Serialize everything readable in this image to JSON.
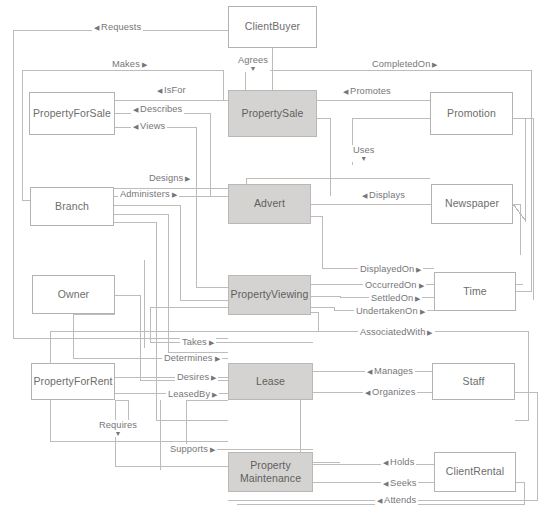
{
  "diagram": {
    "colors": {
      "shaded_fill": "#d4d3d1",
      "box_border": "#b3b3b1",
      "line": "#b8b8b6",
      "text": "#6d6d6b",
      "label_text": "#76767a",
      "background": "#ffffff"
    },
    "entities": [
      {
        "id": "client_buyer",
        "label": "ClientBuyer",
        "shaded": false,
        "x": 228,
        "y": 6,
        "w": 89,
        "h": 42
      },
      {
        "id": "property_for_sale",
        "label": "PropertyForSale",
        "shaded": false,
        "x": 29,
        "y": 92,
        "w": 86,
        "h": 43
      },
      {
        "id": "property_sale",
        "label": "PropertySale",
        "shaded": true,
        "x": 228,
        "y": 90,
        "w": 89,
        "h": 47
      },
      {
        "id": "promotion",
        "label": "Promotion",
        "shaded": false,
        "x": 430,
        "y": 92,
        "w": 83,
        "h": 43
      },
      {
        "id": "branch",
        "label": "Branch",
        "shaded": false,
        "x": 30,
        "y": 187,
        "w": 84,
        "h": 39
      },
      {
        "id": "advert",
        "label": "Advert",
        "shaded": true,
        "x": 228,
        "y": 184,
        "w": 83,
        "h": 40
      },
      {
        "id": "newspaper",
        "label": "Newspaper",
        "shaded": false,
        "x": 431,
        "y": 184,
        "w": 82,
        "h": 40
      },
      {
        "id": "owner",
        "label": "Owner",
        "shaded": false,
        "x": 32,
        "y": 275,
        "w": 83,
        "h": 39
      },
      {
        "id": "property_viewing",
        "label": "PropertyViewing",
        "shaded": true,
        "x": 228,
        "y": 275,
        "w": 83,
        "h": 40
      },
      {
        "id": "time",
        "label": "Time",
        "shaded": false,
        "x": 434,
        "y": 272,
        "w": 82,
        "h": 39
      },
      {
        "id": "property_for_rent",
        "label": "PropertyForRent",
        "shaded": false,
        "x": 31,
        "y": 363,
        "w": 84,
        "h": 37
      },
      {
        "id": "lease",
        "label": "Lease",
        "shaded": true,
        "x": 228,
        "y": 363,
        "w": 85,
        "h": 37
      },
      {
        "id": "staff",
        "label": "Staff",
        "shaded": false,
        "x": 432,
        "y": 363,
        "w": 83,
        "h": 37
      },
      {
        "id": "property_maintenance",
        "label": "Property\nMaintenance",
        "shaded": true,
        "x": 228,
        "y": 452,
        "w": 85,
        "h": 40
      },
      {
        "id": "client_rental",
        "label": "ClientRental",
        "shaded": false,
        "x": 434,
        "y": 452,
        "w": 82,
        "h": 40
      }
    ],
    "relationships": [
      {
        "id": "requests",
        "label": "Requests",
        "arrow": "left",
        "x": 92,
        "y": 22,
        "dir": "l"
      },
      {
        "id": "makes",
        "label": "Makes",
        "arrow": "right",
        "x": 110,
        "y": 59,
        "dir": "r"
      },
      {
        "id": "agrees",
        "label": "Agrees",
        "arrow": "down",
        "x": 236,
        "y": 55,
        "dir": "dn"
      },
      {
        "id": "completed_on",
        "label": "CompletedOn",
        "arrow": "right",
        "x": 370,
        "y": 59,
        "dir": "r"
      },
      {
        "id": "is_for",
        "label": "IsFor",
        "arrow": "left",
        "x": 155,
        "y": 85,
        "dir": "l"
      },
      {
        "id": "promotes",
        "label": "Promotes",
        "arrow": "left",
        "x": 341,
        "y": 86,
        "dir": "l"
      },
      {
        "id": "describes",
        "label": "Describes",
        "arrow": "left",
        "x": 131,
        "y": 104,
        "dir": "l"
      },
      {
        "id": "views",
        "label": "Views",
        "arrow": "left",
        "x": 131,
        "y": 121,
        "dir": "l"
      },
      {
        "id": "uses",
        "label": "Uses",
        "arrow": "down",
        "x": 351,
        "y": 145,
        "dir": "dn"
      },
      {
        "id": "designs",
        "label": "Designs",
        "arrow": "right",
        "x": 147,
        "y": 173,
        "dir": "r"
      },
      {
        "id": "administers",
        "label": "Administers",
        "arrow": "right",
        "x": 118,
        "y": 189,
        "dir": "r"
      },
      {
        "id": "displays",
        "label": "Displays",
        "arrow": "left",
        "x": 360,
        "y": 190,
        "dir": "l"
      },
      {
        "id": "displayed_on",
        "label": "DisplayedOn",
        "arrow": "right",
        "x": 358,
        "y": 264,
        "dir": "r"
      },
      {
        "id": "occurred_on",
        "label": "OccurredOn",
        "arrow": "right",
        "x": 363,
        "y": 280,
        "dir": "r"
      },
      {
        "id": "settled_on",
        "label": "SettledOn",
        "arrow": "right",
        "x": 369,
        "y": 293,
        "dir": "r"
      },
      {
        "id": "undertaken_on",
        "label": "UndertakenOn",
        "arrow": "right",
        "x": 354,
        "y": 306,
        "dir": "r"
      },
      {
        "id": "associated_with",
        "label": "AssociatedWith",
        "arrow": "right",
        "x": 358,
        "y": 327,
        "dir": "r"
      },
      {
        "id": "takes",
        "label": "Takes",
        "arrow": "right",
        "x": 180,
        "y": 337,
        "dir": "r"
      },
      {
        "id": "determines",
        "label": "Determines",
        "arrow": "right",
        "x": 162,
        "y": 353,
        "dir": "r"
      },
      {
        "id": "manages",
        "label": "Manages",
        "arrow": "left",
        "x": 365,
        "y": 366,
        "dir": "l"
      },
      {
        "id": "desires",
        "label": "Desires",
        "arrow": "right",
        "x": 175,
        "y": 372,
        "dir": "r"
      },
      {
        "id": "leased_by",
        "label": "LeasedBy",
        "arrow": "right",
        "x": 166,
        "y": 389,
        "dir": "r"
      },
      {
        "id": "organizes",
        "label": "Organizes",
        "arrow": "left",
        "x": 363,
        "y": 387,
        "dir": "l"
      },
      {
        "id": "requires",
        "label": "Requires",
        "arrow": "down",
        "x": 97,
        "y": 420,
        "dir": "dn"
      },
      {
        "id": "supports",
        "label": "Supports",
        "arrow": "right",
        "x": 168,
        "y": 444,
        "dir": "r"
      },
      {
        "id": "holds",
        "label": "Holds",
        "arrow": "left",
        "x": 381,
        "y": 457,
        "dir": "l"
      },
      {
        "id": "seeks",
        "label": "Seeks",
        "arrow": "left",
        "x": 381,
        "y": 478,
        "dir": "l"
      },
      {
        "id": "attends",
        "label": "Attends",
        "arrow": "left",
        "x": 375,
        "y": 495,
        "dir": "l"
      }
    ],
    "arrow_glyphs": {
      "left": "◀",
      "right": "▶",
      "down": "▼"
    }
  }
}
